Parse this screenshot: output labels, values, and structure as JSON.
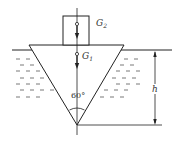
{
  "diagram": {
    "labels": {
      "G2": {
        "main": "G",
        "sub": "2"
      },
      "G1": {
        "main": "G",
        "sub": "1"
      },
      "angle": "60°",
      "depth": "h"
    },
    "colors": {
      "stroke": "#222222",
      "water": "#555555",
      "background": "#ffffff"
    }
  }
}
